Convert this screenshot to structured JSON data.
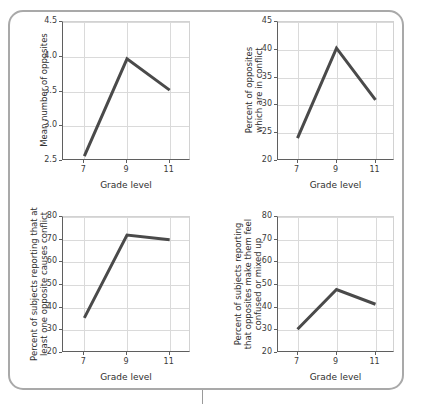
{
  "figure": {
    "panel_border_color": "#a9a9a9",
    "line_color": "#4a4a4a",
    "grid_color": "#dadada",
    "axis_color": "#5f5f5f"
  },
  "shared": {
    "xlabel": "Grade level",
    "xticks": [
      "7",
      "9",
      "11"
    ],
    "x_values": [
      7,
      9,
      11
    ]
  },
  "chart_data": [
    {
      "id": "top-left",
      "type": "line",
      "title": "",
      "ylabel": "Mean number of opposites",
      "ylabel_lines": [
        "Mean number of opposites"
      ],
      "xlabel": "Grade level",
      "categories": [
        "7",
        "9",
        "11"
      ],
      "x": [
        7,
        9,
        11
      ],
      "values": [
        2.57,
        3.97,
        3.52
      ],
      "yticks": [
        "2.5",
        "3.0",
        "3.5",
        "4.0",
        "4.5"
      ],
      "ytick_values": [
        2.5,
        3.0,
        3.5,
        4.0,
        4.5
      ],
      "ylim": [
        2.5,
        4.5
      ],
      "xlim": [
        6,
        12
      ],
      "grid": true,
      "legend": "none"
    },
    {
      "id": "top-right",
      "type": "line",
      "title": "",
      "ylabel": "Percent of opposites which are in conflict",
      "ylabel_lines": [
        "Percent of opposites",
        "which are in conflict"
      ],
      "xlabel": "Grade level",
      "categories": [
        "7",
        "9",
        "11"
      ],
      "x": [
        7,
        9,
        11
      ],
      "values": [
        24.1,
        40.3,
        31.0
      ],
      "yticks": [
        "20",
        "25",
        "30",
        "35",
        "40",
        "45"
      ],
      "ytick_values": [
        20,
        25,
        30,
        35,
        40,
        45
      ],
      "ylim": [
        20,
        45
      ],
      "xlim": [
        6,
        12
      ],
      "grid": true,
      "legend": "none"
    },
    {
      "id": "bottom-left",
      "type": "line",
      "title": "",
      "ylabel": "Percent of subjects reporting that at least one opposite causes conflict",
      "ylabel_lines": [
        "Percent of subjects reporting that at",
        "least one opposite causes conflict"
      ],
      "xlabel": "Grade level",
      "categories": [
        "7",
        "9",
        "11"
      ],
      "x": [
        7,
        9,
        11
      ],
      "values": [
        35.5,
        72.0,
        70.0
      ],
      "yticks": [
        "20",
        "30",
        "40",
        "50",
        "60",
        "70",
        "80"
      ],
      "ytick_values": [
        20,
        30,
        40,
        50,
        60,
        70,
        80
      ],
      "ylim": [
        20,
        80
      ],
      "xlim": [
        6,
        12
      ],
      "grid": true,
      "legend": "none"
    },
    {
      "id": "bottom-right",
      "type": "line",
      "title": "",
      "ylabel": "Percent of subjects reporting that opposites make them feel confused or mixed up",
      "ylabel_lines": [
        "Percent of subjects reporting",
        "that opposites make them feel",
        "confused or mixed up"
      ],
      "xlabel": "Grade level",
      "categories": [
        "7",
        "9",
        "11"
      ],
      "x": [
        7,
        9,
        11
      ],
      "values": [
        30.5,
        48.0,
        41.5
      ],
      "yticks": [
        "20",
        "30",
        "40",
        "50",
        "60",
        "70",
        "80"
      ],
      "ytick_values": [
        20,
        30,
        40,
        50,
        60,
        70,
        80
      ],
      "ylim": [
        20,
        80
      ],
      "xlim": [
        6,
        12
      ],
      "grid": true,
      "legend": "none"
    }
  ],
  "layout": {
    "panels": [
      {
        "id": "top-left",
        "plot": {
          "left": 62,
          "top": 21,
          "width": 128,
          "height": 139
        },
        "ylabel_cx": 44,
        "ylabel_cy": 90,
        "ylabel_lines": 1
      },
      {
        "id": "top-right",
        "plot": {
          "left": 277,
          "top": 21,
          "width": 117,
          "height": 139
        },
        "ylabel_cx": 254,
        "ylabel_cy": 90,
        "ylabel_lines": 2
      },
      {
        "id": "bottom-left",
        "plot": {
          "left": 62,
          "top": 216,
          "width": 128,
          "height": 136
        },
        "ylabel_cx": 39,
        "ylabel_cy": 284,
        "ylabel_lines": 2
      },
      {
        "id": "bottom-right",
        "plot": {
          "left": 277,
          "top": 216,
          "width": 117,
          "height": 136
        },
        "ylabel_cx": 248,
        "ylabel_cy": 284,
        "ylabel_lines": 3
      }
    ]
  }
}
